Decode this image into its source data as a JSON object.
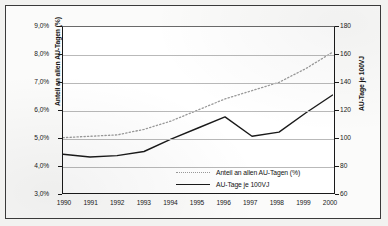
{
  "chart_data": {
    "type": "line",
    "title": "",
    "subtitle": "",
    "xlabel": "",
    "ylabel": "Anteil an allen AU-Tagen (%)",
    "ylabel_secondary": "AU-Tage je 100VJ",
    "grid": true,
    "legend_position": "inside-bottom-right",
    "x": [
      "1990",
      "1991",
      "1992",
      "1993",
      "1994",
      "1995",
      "1996",
      "1997",
      "1998",
      "1999",
      "2000"
    ],
    "categories": [
      "1990",
      "1991",
      "1992",
      "1993",
      "1994",
      "1995",
      "1996",
      "1997",
      "1998",
      "1999",
      "2000"
    ],
    "yticks_left": [
      "3,0%",
      "4,0%",
      "5,0%",
      "6,0%",
      "7,0%",
      "8,0%",
      "9,0%"
    ],
    "yticks_right": [
      "60",
      "80",
      "100",
      "120",
      "140",
      "160",
      "180"
    ],
    "ylim": [
      3.0,
      9.0
    ],
    "ylim_secondary": [
      60,
      180
    ],
    "series": [
      {
        "name": "Anteil an allen AU-Tagen (%)",
        "axis": "left",
        "style": "dotted",
        "color": "#9a9a9a",
        "values": [
          5.0,
          5.05,
          5.1,
          5.3,
          5.6,
          6.0,
          6.4,
          6.7,
          7.0,
          7.5,
          8.1
        ]
      },
      {
        "name": "AU-Tage je 100VJ",
        "axis": "right",
        "style": "solid",
        "color": "#1a1a1a",
        "values": [
          88,
          86,
          87,
          90,
          99,
          107,
          115,
          101,
          104,
          118,
          131
        ]
      }
    ],
    "legend": [
      {
        "label": "Anteil an allen AU-Tagen (%)",
        "style": "dotted"
      },
      {
        "label": "AU-Tage je 100VJ",
        "style": "solid"
      }
    ]
  },
  "axes": {
    "left_title": "Anteil an allen AU-Tagen (%)",
    "right_title": "AU-Tage je 100VJ"
  }
}
